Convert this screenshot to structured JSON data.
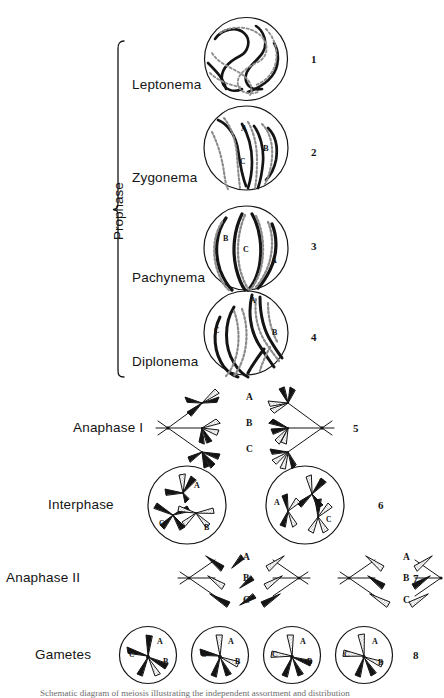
{
  "figure": {
    "background_color": "#ffffff",
    "ink_color": "#141414",
    "stipple_color": "#8c8c8c"
  },
  "bracket": {
    "label": "Prophase",
    "covers_stages": [
      "Leptonema",
      "Zygonema",
      "Pachynema",
      "Diplonema"
    ]
  },
  "stages": [
    {
      "label": "Leptonema",
      "number": "1",
      "kind": "circle-cell",
      "chromosome_labels": []
    },
    {
      "label": "Zygonema",
      "number": "2",
      "kind": "circle-cell",
      "chromosome_labels": [
        "A",
        "B",
        "C"
      ]
    },
    {
      "label": "Pachynema",
      "number": "3",
      "kind": "circle-cell",
      "chromosome_labels": [
        "A",
        "B",
        "C"
      ]
    },
    {
      "label": "Diplonema",
      "number": "4",
      "kind": "circle-cell",
      "chromosome_labels": [
        "A",
        "B",
        "C"
      ]
    },
    {
      "label": "Anaphase  I",
      "number": "5",
      "kind": "spindle-pair",
      "chromosome_labels": [
        "A",
        "B",
        "C"
      ]
    },
    {
      "label": "Interphase",
      "number": "6",
      "kind": "circle-pair",
      "chromosome_labels": [
        "A",
        "B",
        "C"
      ]
    },
    {
      "label": "Anaphase  II",
      "number": "7",
      "kind": "spindle-quad",
      "chromosome_labels": [
        "A",
        "B",
        "C"
      ]
    },
    {
      "label": "Gametes",
      "number": "8",
      "kind": "circle-quad",
      "chromosome_labels": [
        "A",
        "B",
        "C"
      ]
    }
  ],
  "center_labels": {
    "anaphase_i": [
      "A",
      "B",
      "C"
    ],
    "anaphase_ii_left": [
      "A",
      "B",
      "C"
    ],
    "anaphase_ii_right": [
      "A",
      "B",
      "C"
    ]
  },
  "caption": "Schematic diagram of meiosis illustrating the independent assortment and distribution"
}
